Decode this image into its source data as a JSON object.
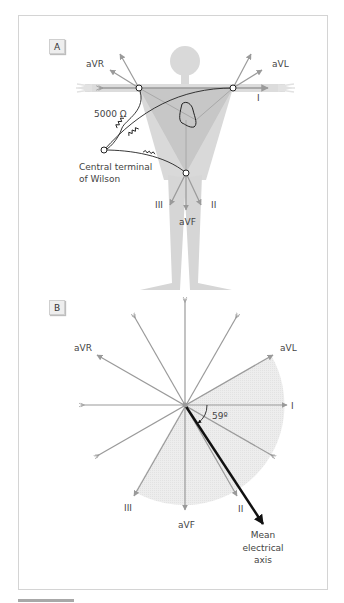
{
  "panels": {
    "a": {
      "label": "A",
      "leads": {
        "aVR": "aVR",
        "aVL": "aVL",
        "I": "I",
        "II": "II",
        "III": "III",
        "aVF": "aVF"
      },
      "resistor_label": "5000 Ω",
      "terminal_label_line1": "Central terminal",
      "terminal_label_line2": "of Wilson"
    },
    "b": {
      "label": "B",
      "leads": {
        "aVR": "aVR",
        "aVL": "aVL",
        "I": "I",
        "II": "II",
        "III": "III",
        "aVF": "aVF"
      },
      "angle_label": "59º",
      "axis_label_line1": "Mean",
      "axis_label_line2": "electrical",
      "axis_label_line3": "axis"
    }
  },
  "colors": {
    "body": "#d9d9d9",
    "triangle": "#c4c4c4",
    "lead_lines": "#9a9a9a",
    "shaded_sector": "#ececec",
    "axis_arrow": "#111111",
    "frame": "#d4d4d4"
  }
}
